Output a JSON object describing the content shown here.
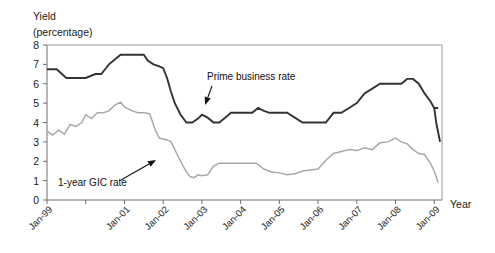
{
  "chart_data": {
    "type": "line",
    "title": "",
    "ylabel_line1": "Yield",
    "ylabel_line2": "(percentage)",
    "xlabel": "Year",
    "ylim": [
      0,
      8
    ],
    "y_ticks": [
      "0",
      "1",
      "2",
      "3",
      "4",
      "5",
      "6",
      "7",
      "8"
    ],
    "x_ticks": [
      "Jan-99",
      "Jan-00",
      "Jan-01",
      "Jan-02",
      "Jan-03",
      "Jan-04",
      "Jan-05",
      "Jan-06",
      "Jan-07",
      "Jan-08",
      "Jan-09"
    ],
    "x_tick_labels_shown": [
      "Jan-99",
      "",
      "Jan-01",
      "Jan-02",
      "Jan-03",
      "Jan-04",
      "Jan-05",
      "Jan-06",
      "Jan-07",
      "Jan-08",
      "Jan-09"
    ],
    "grid": false,
    "legend_position": "inline-annotations",
    "x_range_years": [
      1999,
      2009.2
    ],
    "series": [
      {
        "name": "Prime business rate",
        "color": "#333333",
        "stroke_width": 1.9,
        "annotation": {
          "text": "Prime business rate",
          "label_x": 207,
          "label_y": 80,
          "arrow_from_x": 212,
          "arrow_from_y": 86,
          "arrow_to_x": 205,
          "arrow_to_y": 105
        },
        "x": [
          1999.0,
          1999.25,
          1999.5,
          1999.6,
          1999.75,
          2000.0,
          2000.25,
          2000.4,
          2000.5,
          2000.6,
          2000.75,
          2000.9,
          2001.0,
          2001.1,
          2001.25,
          2001.4,
          2001.5,
          2001.6,
          2001.75,
          2001.9,
          2002.0,
          2002.1,
          2002.2,
          2002.3,
          2002.45,
          2002.6,
          2002.75,
          2002.9,
          2003.0,
          2003.15,
          2003.3,
          2003.45,
          2003.6,
          2003.75,
          2003.9,
          2004.0,
          2004.15,
          2004.3,
          2004.45,
          2004.6,
          2004.75,
          2004.9,
          2005.0,
          2005.2,
          2005.4,
          2005.6,
          2005.8,
          2006.0,
          2006.2,
          2006.4,
          2006.6,
          2006.8,
          2007.0,
          2007.2,
          2007.4,
          2007.6,
          2007.8,
          2008.0,
          2008.15,
          2008.3,
          2008.45,
          2008.6,
          2008.75,
          2008.9,
          2009.0,
          2009.1
        ],
        "y": [
          6.75,
          6.75,
          6.3,
          6.3,
          6.3,
          6.3,
          6.5,
          6.5,
          6.75,
          7.0,
          7.25,
          7.5,
          7.5,
          7.5,
          7.5,
          7.5,
          7.5,
          7.2,
          7.0,
          6.9,
          6.8,
          6.3,
          5.6,
          5.0,
          4.4,
          4.0,
          4.0,
          4.2,
          4.4,
          4.25,
          4.0,
          4.0,
          4.25,
          4.5,
          4.5,
          4.5,
          4.5,
          4.5,
          4.75,
          4.6,
          4.5,
          4.5,
          4.5,
          4.5,
          4.25,
          4.0,
          4.0,
          4.0,
          4.0,
          4.5,
          4.5,
          4.75,
          5.0,
          5.5,
          5.75,
          6.0,
          6.0,
          6.0,
          6.0,
          6.25,
          6.25,
          6.0,
          5.5,
          5.1,
          4.75,
          4.75
        ],
        "y_tail": [
          4.75,
          4.0,
          3.5,
          3.0
        ],
        "x_tail": [
          2009.0,
          2009.05,
          2009.1,
          2009.15
        ]
      },
      {
        "name": "1-year GIC rate",
        "color": "#a8a8a8",
        "stroke_width": 1.5,
        "annotation": {
          "text": "1-year GIC rate",
          "label_x": 58,
          "label_y": 186,
          "arrow_from_x": 121,
          "arrow_from_y": 180,
          "arrow_to_x": 156,
          "arrow_to_y": 160
        },
        "x": [
          1999.0,
          1999.15,
          1999.3,
          1999.45,
          1999.6,
          1999.75,
          1999.9,
          2000.0,
          2000.15,
          2000.3,
          2000.45,
          2000.6,
          2000.75,
          2000.9,
          2001.0,
          2001.1,
          2001.2,
          2001.35,
          2001.5,
          2001.65,
          2001.8,
          2001.9,
          2002.0,
          2002.1,
          2002.2,
          2002.35,
          2002.5,
          2002.6,
          2002.7,
          2002.8,
          2002.9,
          2003.0,
          2003.15,
          2003.3,
          2003.45,
          2003.6,
          2003.75,
          2003.9,
          2004.0,
          2004.2,
          2004.4,
          2004.6,
          2004.8,
          2005.0,
          2005.2,
          2005.4,
          2005.6,
          2005.8,
          2006.0,
          2006.2,
          2006.4,
          2006.6,
          2006.8,
          2007.0,
          2007.2,
          2007.4,
          2007.6,
          2007.8,
          2008.0,
          2008.15,
          2008.3,
          2008.45,
          2008.6,
          2008.75,
          2008.9,
          2009.0,
          2009.1
        ],
        "y": [
          3.55,
          3.35,
          3.6,
          3.4,
          3.9,
          3.8,
          4.0,
          4.4,
          4.2,
          4.5,
          4.5,
          4.6,
          4.9,
          5.05,
          4.8,
          4.7,
          4.6,
          4.5,
          4.5,
          4.45,
          3.6,
          3.2,
          3.15,
          3.1,
          3.0,
          2.4,
          1.8,
          1.45,
          1.2,
          1.15,
          1.3,
          1.25,
          1.3,
          1.75,
          1.9,
          1.9,
          1.9,
          1.9,
          1.9,
          1.9,
          1.9,
          1.6,
          1.45,
          1.4,
          1.3,
          1.35,
          1.5,
          1.55,
          1.6,
          2.05,
          2.4,
          2.5,
          2.6,
          2.55,
          2.7,
          2.6,
          2.95,
          3.0,
          3.2,
          3.0,
          2.9,
          2.6,
          2.4,
          2.35,
          1.9,
          1.5,
          0.9
        ],
        "y_tail": [],
        "x_tail": []
      }
    ]
  },
  "axes": {
    "y_axis_name": "yield-axis",
    "x_axis_name": "year-axis"
  }
}
